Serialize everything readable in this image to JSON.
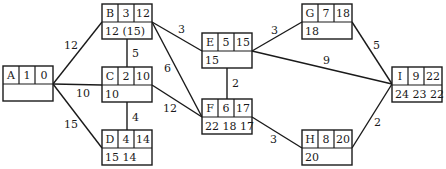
{
  "diagram": {
    "title": "",
    "type": "activity-network",
    "nodes": [
      {
        "id": "A",
        "x": 3,
        "y": 66,
        "duration": "1",
        "value": "0",
        "bottom": ""
      },
      {
        "id": "B",
        "x": 102,
        "y": 4,
        "duration": "3",
        "value": "12",
        "bottom": "12 (15)"
      },
      {
        "id": "C",
        "x": 102,
        "y": 67,
        "duration": "2",
        "value": "10",
        "bottom": "10"
      },
      {
        "id": "D",
        "x": 102,
        "y": 130,
        "duration": "4",
        "value": "14",
        "bottom": "15 14"
      },
      {
        "id": "E",
        "x": 202,
        "y": 33,
        "duration": "5",
        "value": "15",
        "bottom": "15"
      },
      {
        "id": "F",
        "x": 202,
        "y": 99,
        "duration": "6",
        "value": "17",
        "bottom": "22 18 17"
      },
      {
        "id": "G",
        "x": 302,
        "y": 4,
        "duration": "7",
        "value": "18",
        "bottom": "18"
      },
      {
        "id": "H",
        "x": 302,
        "y": 130,
        "duration": "8",
        "value": "20",
        "bottom": "20"
      },
      {
        "id": "I",
        "x": 392,
        "y": 67,
        "duration": "9",
        "value": "22",
        "bottom": "24 23 22"
      }
    ],
    "edges": [
      {
        "from": "A",
        "to": "B",
        "weight": "12",
        "x1": 53,
        "y1": 84,
        "x2": 102,
        "y2": 22,
        "lx": 64,
        "ly": 49
      },
      {
        "from": "A",
        "to": "C",
        "weight": "10",
        "x1": 53,
        "y1": 84,
        "x2": 102,
        "y2": 85,
        "lx": 76,
        "ly": 97
      },
      {
        "from": "A",
        "to": "D",
        "weight": "15",
        "x1": 53,
        "y1": 84,
        "x2": 102,
        "y2": 148,
        "lx": 64,
        "ly": 128
      },
      {
        "from": "B",
        "to": "C",
        "weight": "5",
        "x1": 127,
        "y1": 39,
        "x2": 127,
        "y2": 67,
        "lx": 132,
        "ly": 57
      },
      {
        "from": "C",
        "to": "D",
        "weight": "4",
        "x1": 127,
        "y1": 101,
        "x2": 127,
        "y2": 130,
        "lx": 132,
        "ly": 121
      },
      {
        "from": "B",
        "to": "E",
        "weight": "3",
        "x1": 152,
        "y1": 22,
        "x2": 202,
        "y2": 51,
        "lx": 178,
        "ly": 33
      },
      {
        "from": "B",
        "to": "F",
        "weight": "6",
        "x1": 152,
        "y1": 22,
        "x2": 202,
        "y2": 117,
        "lx": 164,
        "ly": 72
      },
      {
        "from": "C",
        "to": "F",
        "weight": "12",
        "x1": 152,
        "y1": 85,
        "x2": 202,
        "y2": 117,
        "lx": 163,
        "ly": 112
      },
      {
        "from": "E",
        "to": "F",
        "weight": "2",
        "x1": 227,
        "y1": 67,
        "x2": 227,
        "y2": 99,
        "lx": 232,
        "ly": 87
      },
      {
        "from": "E",
        "to": "G",
        "weight": "3",
        "x1": 252,
        "y1": 51,
        "x2": 302,
        "y2": 22,
        "lx": 271,
        "ly": 34
      },
      {
        "from": "E",
        "to": "I",
        "weight": "9",
        "x1": 252,
        "y1": 51,
        "x2": 392,
        "y2": 84,
        "lx": 323,
        "ly": 64
      },
      {
        "from": "G",
        "to": "I",
        "weight": "5",
        "x1": 352,
        "y1": 22,
        "x2": 392,
        "y2": 84,
        "lx": 373,
        "ly": 49
      },
      {
        "from": "F",
        "to": "H",
        "weight": "3",
        "x1": 252,
        "y1": 117,
        "x2": 302,
        "y2": 148,
        "lx": 270,
        "ly": 143
      },
      {
        "from": "H",
        "to": "I",
        "weight": "2",
        "x1": 352,
        "y1": 148,
        "x2": 392,
        "y2": 84,
        "lx": 374,
        "ly": 126
      }
    ],
    "box": {
      "width": 50,
      "header_height": 18,
      "body_height": 17,
      "cell_widths": [
        16,
        16,
        18
      ]
    },
    "colors": {
      "stroke": "#1a1a1a",
      "background": "#ffffff"
    }
  }
}
